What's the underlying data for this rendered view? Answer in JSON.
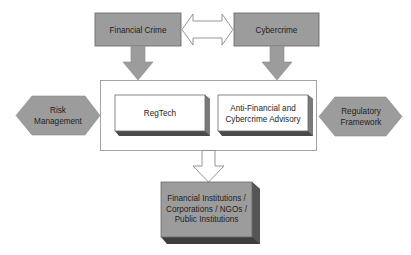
{
  "diagram": {
    "sources": {
      "financial_crime": {
        "label": "Financial Crime"
      },
      "cybercrime": {
        "label": "Cybercrime"
      }
    },
    "center": {
      "regtech": {
        "label": "RegTech"
      },
      "advisory": {
        "line1": "Anti-Financial and",
        "line2": "Cybercrime Advisory"
      }
    },
    "sides": {
      "risk_management": {
        "line1": "Risk",
        "line2": "Management"
      },
      "regulatory_framework": {
        "line1": "Regulatory",
        "line2": "Framework"
      }
    },
    "target": {
      "line1": "Financial Institutions /",
      "line2": "Corporations / NGOs /",
      "line3": "Public Institutions"
    },
    "colors": {
      "gray_fill": "#9c9c9c",
      "dark_edge": "#5a5a5a",
      "shadow": "#4a4a4a",
      "white_fill": "#ffffff",
      "outline": "#8a8a8a"
    }
  }
}
